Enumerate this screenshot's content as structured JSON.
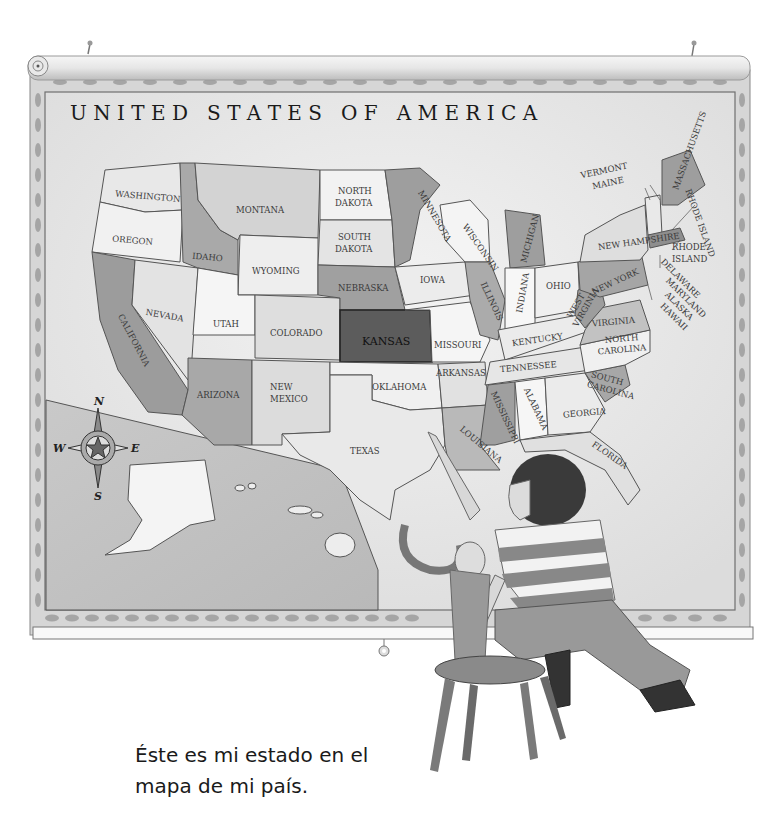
{
  "map": {
    "title": "U N I T E D   S T A T E S   O F   A M E R I C A",
    "highlighted_state": "KANSAS",
    "states": [
      {
        "name": "WASHINGTON",
        "x": 145,
        "y": 199,
        "rot": 5
      },
      {
        "name": "OREGON",
        "x": 130,
        "y": 243,
        "rot": 5
      },
      {
        "name": "CALIFORNIA",
        "x": 118,
        "y": 342,
        "rot": 62
      },
      {
        "name": "NEVADA",
        "x": 163,
        "y": 318,
        "rot": 10
      },
      {
        "name": "IDAHO",
        "x": 207,
        "y": 258,
        "rot": 5
      },
      {
        "name": "MONTANA",
        "x": 260,
        "y": 211,
        "rot": 3
      },
      {
        "name": "WYOMING",
        "x": 275,
        "y": 272,
        "rot": 3
      },
      {
        "name": "UTAH",
        "x": 226,
        "y": 326,
        "rot": 3
      },
      {
        "name": "COLORADO",
        "x": 297,
        "y": 335,
        "rot": 2
      },
      {
        "name": "ARIZONA",
        "x": 218,
        "y": 396,
        "rot": 3
      },
      {
        "name": "NEW MEXICO",
        "x": 292,
        "y": 394,
        "rot": 0
      },
      {
        "name": "NORTH DAKOTA",
        "x": 356,
        "y": 197,
        "rot": 0
      },
      {
        "name": "SOUTH DAKOTA",
        "x": 357,
        "y": 242,
        "rot": 0
      },
      {
        "name": "NEBRASKA",
        "x": 363,
        "y": 289,
        "rot": 2
      },
      {
        "name": "KANSAS",
        "x": 388,
        "y": 342,
        "rot": 0
      },
      {
        "name": "OKLAHOMA",
        "x": 402,
        "y": 388,
        "rot": 0
      },
      {
        "name": "TEXAS",
        "x": 367,
        "y": 452,
        "rot": 0
      },
      {
        "name": "MINNESOTA",
        "x": 413,
        "y": 216,
        "rot": 60
      },
      {
        "name": "IOWA",
        "x": 433,
        "y": 281,
        "rot": 0
      },
      {
        "name": "MISSOURI",
        "x": 455,
        "y": 346,
        "rot": 0
      },
      {
        "name": "ARKANSAS",
        "x": 459,
        "y": 374,
        "rot": 0
      },
      {
        "name": "LOUISIANA",
        "x": 472,
        "y": 446,
        "rot": 40
      },
      {
        "name": "WISCONSIN",
        "x": 472,
        "y": 244,
        "rot": 55
      },
      {
        "name": "ILLINOIS",
        "x": 488,
        "y": 300,
        "rot": 65
      },
      {
        "name": "MICHIGAN",
        "x": 528,
        "y": 245,
        "rot": -75
      },
      {
        "name": "INDIANA",
        "x": 522,
        "y": 296,
        "rot": -80
      },
      {
        "name": "OHIO",
        "x": 556,
        "y": 287,
        "rot": -5
      },
      {
        "name": "KENTUCKY",
        "x": 535,
        "y": 341,
        "rot": -8
      },
      {
        "name": "TENNESSEE",
        "x": 525,
        "y": 368,
        "rot": -5
      },
      {
        "name": "MISSISSIPPI",
        "x": 500,
        "y": 413,
        "rot": 65
      },
      {
        "name": "ALABAMA",
        "x": 531,
        "y": 405,
        "rot": 65
      },
      {
        "name": "GEORGIA",
        "x": 582,
        "y": 414,
        "rot": -5
      },
      {
        "name": "FLORIDA",
        "x": 606,
        "y": 456,
        "rot": 35
      },
      {
        "name": "SOUTH CAROLINA",
        "x": 602,
        "y": 380,
        "rot": 15
      },
      {
        "name": "NORTH CAROLINA",
        "x": 616,
        "y": 345,
        "rot": -5
      },
      {
        "name": "VIRGINIA",
        "x": 610,
        "y": 323,
        "rot": -5
      },
      {
        "name": "WEST VIRGINIA",
        "x": 579,
        "y": 310,
        "rot": -60
      },
      {
        "name": "PENNSYLVANIA",
        "x": 614,
        "y": 282,
        "rot": -25
      },
      {
        "name": "NEW YORK",
        "x": 620,
        "y": 245,
        "rot": -8
      },
      {
        "name": "NEW HAMPSHIRE",
        "x": 620,
        "y": 168,
        "rot": -12
      },
      {
        "name": "VERMONT",
        "x": 622,
        "y": 181,
        "rot": -12
      },
      {
        "name": "MAINE",
        "x": 679,
        "y": 176,
        "rot": -70
      },
      {
        "name": "MASSACHUSETTS",
        "x": 700,
        "y": 222,
        "rot": 70
      },
      {
        "name": "RHODE ISLAND",
        "x": 688,
        "y": 252,
        "rot": 0
      },
      {
        "name": "CONNECTICUT",
        "x": 680,
        "y": 282,
        "rot": 45
      },
      {
        "name": "NEW JERSEY",
        "x": 683,
        "y": 296,
        "rot": 45
      },
      {
        "name": "DELAWARE",
        "x": 680,
        "y": 308,
        "rot": 45
      },
      {
        "name": "MARYLAND",
        "x": 676,
        "y": 320,
        "rot": 45
      },
      {
        "name": "ALASKA",
        "x": 160,
        "y": 490,
        "rot": 8
      },
      {
        "name": "HAWAII",
        "x": 280,
        "y": 525,
        "rot": 15
      }
    ],
    "compass": {
      "n": "N",
      "s": "S",
      "e": "E",
      "w": "W"
    }
  },
  "caption": {
    "line1": "Éste es mi estado en el",
    "line2": "mapa de mi país."
  },
  "colors": {
    "background": "#ffffff",
    "map_paper": "#ececec",
    "border": "#d2d2d2",
    "highlight": "#5c5c5c",
    "text": "#1a1a1a"
  }
}
